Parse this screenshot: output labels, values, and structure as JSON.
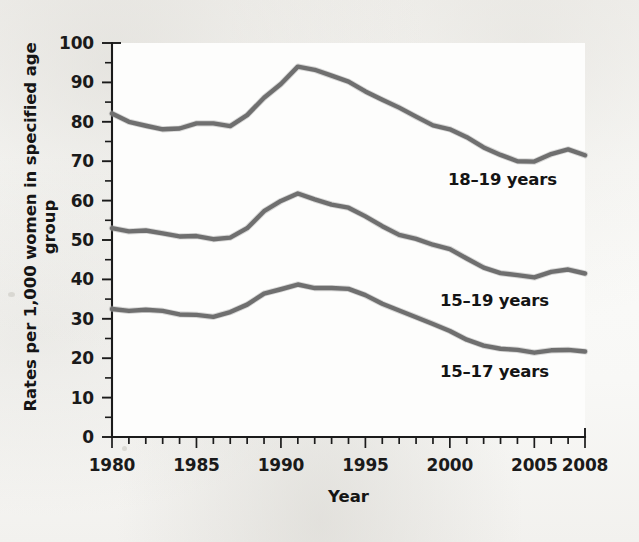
{
  "chart_data": {
    "type": "line",
    "title": "",
    "xlabel": "Year",
    "ylabel": "Rates per 1,000 women in specified age group",
    "xlim": [
      1980,
      2008
    ],
    "ylim": [
      0,
      100
    ],
    "grid": false,
    "legend_position": "inline-labels",
    "x_tick_labels": [
      "1980",
      "1985",
      "1990",
      "1995",
      "2000",
      "2005",
      "2008"
    ],
    "x_tick_values": [
      1980,
      1985,
      1990,
      1995,
      2000,
      2005,
      2008
    ],
    "x_minor_tick_interval": 1,
    "y_tick_labels": [
      "0",
      "10",
      "20",
      "30",
      "40",
      "50",
      "60",
      "70",
      "80",
      "90",
      "100"
    ],
    "y_tick_values": [
      0,
      10,
      20,
      30,
      40,
      50,
      60,
      70,
      80,
      90,
      100
    ],
    "y_minor_tick_interval": 5,
    "line_color": "#6f6f6f",
    "axis_color": "#1b1b1b",
    "x": [
      1980,
      1981,
      1982,
      1983,
      1984,
      1985,
      1986,
      1987,
      1988,
      1989,
      1990,
      1991,
      1992,
      1993,
      1994,
      1995,
      1996,
      1997,
      1998,
      1999,
      2000,
      2001,
      2002,
      2003,
      2004,
      2005,
      2006,
      2007,
      2008
    ],
    "series": [
      {
        "name": "18-19 years",
        "label": "18–19 years",
        "values": [
          82.1,
          80.0,
          79.0,
          78.1,
          78.3,
          79.6,
          79.6,
          78.9,
          81.7,
          86.1,
          89.6,
          94.0,
          93.2,
          91.7,
          90.2,
          87.7,
          85.6,
          83.6,
          81.3,
          79.1,
          78.1,
          76.1,
          73.5,
          71.6,
          70.0,
          69.9,
          71.8,
          73.0,
          71.5
        ]
      },
      {
        "name": "15-19 years",
        "label": "15–19 years",
        "values": [
          53.0,
          52.2,
          52.4,
          51.7,
          50.9,
          51.0,
          50.2,
          50.6,
          53.0,
          57.3,
          59.9,
          61.8,
          60.3,
          59.0,
          58.2,
          56.0,
          53.5,
          51.3,
          50.3,
          48.8,
          47.7,
          45.3,
          43.0,
          41.6,
          41.1,
          40.5,
          41.9,
          42.5,
          41.5
        ]
      },
      {
        "name": "15-17 years",
        "label": "15–17 years",
        "values": [
          32.5,
          32.0,
          32.3,
          32.0,
          31.1,
          31.0,
          30.5,
          31.7,
          33.6,
          36.4,
          37.5,
          38.7,
          37.8,
          37.8,
          37.6,
          36.0,
          33.8,
          32.1,
          30.4,
          28.7,
          26.9,
          24.7,
          23.2,
          22.4,
          22.1,
          21.4,
          22.0,
          22.1,
          21.7
        ]
      }
    ],
    "series_label_positions": [
      {
        "series": "18-19 years",
        "x_px": 448,
        "y_px": 170
      },
      {
        "series": "15-19 years",
        "x_px": 440,
        "y_px": 291
      },
      {
        "series": "15-17 years",
        "x_px": 440,
        "y_px": 362
      }
    ]
  }
}
